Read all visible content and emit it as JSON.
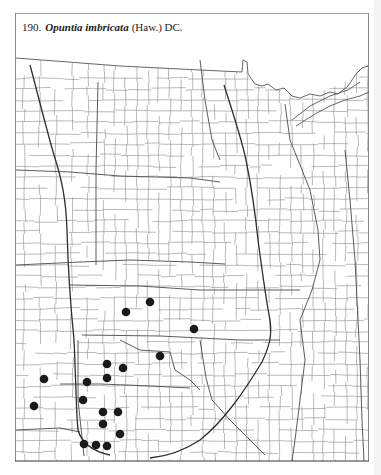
{
  "figure": {
    "number": "190.",
    "species": "Opuntia imbricata",
    "author": "(Haw.) DC."
  },
  "map": {
    "region": "Great Plains and Upper Midwest county outline map",
    "line_color": "#555555",
    "thick_line_color": "#333333",
    "dot_color": "#1a1a1a",
    "occurrence_dots": [
      {
        "x": 150,
        "y": 302
      },
      {
        "x": 126,
        "y": 312
      },
      {
        "x": 194,
        "y": 329
      },
      {
        "x": 160,
        "y": 356
      },
      {
        "x": 107,
        "y": 364
      },
      {
        "x": 123,
        "y": 368
      },
      {
        "x": 44,
        "y": 379
      },
      {
        "x": 87,
        "y": 382
      },
      {
        "x": 107,
        "y": 378
      },
      {
        "x": 83,
        "y": 400
      },
      {
        "x": 34,
        "y": 406
      },
      {
        "x": 103,
        "y": 412
      },
      {
        "x": 118,
        "y": 412
      },
      {
        "x": 103,
        "y": 424
      },
      {
        "x": 120,
        "y": 434
      },
      {
        "x": 84,
        "y": 444
      },
      {
        "x": 96,
        "y": 445
      },
      {
        "x": 107,
        "y": 446
      }
    ]
  }
}
